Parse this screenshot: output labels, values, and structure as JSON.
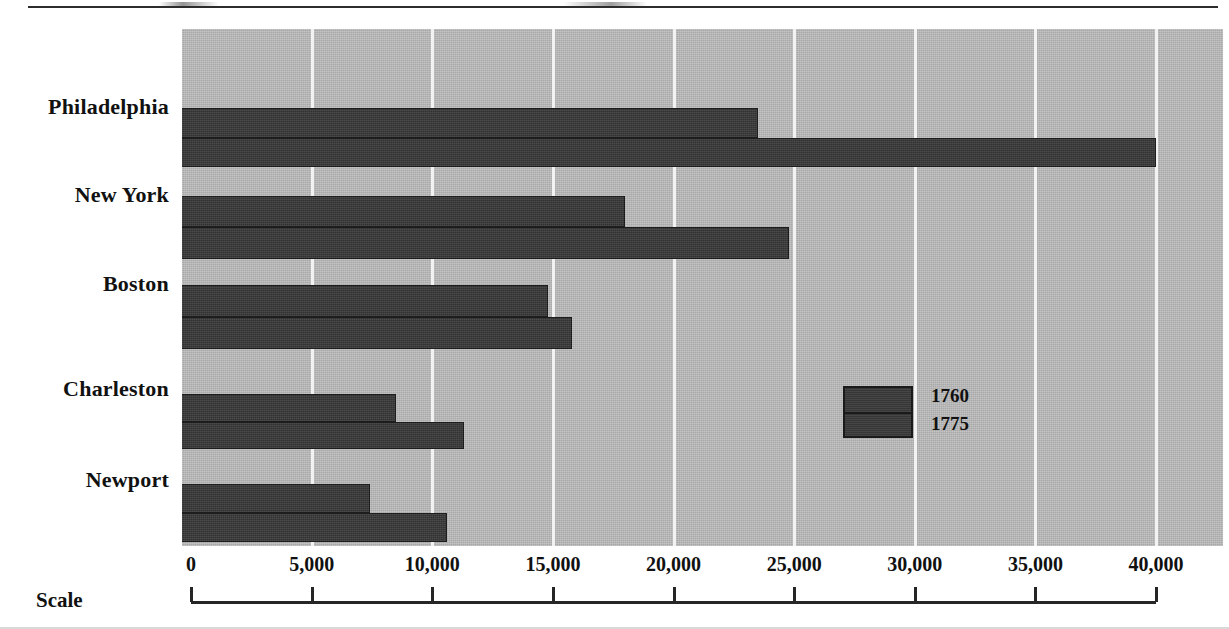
{
  "page": {
    "top_rule_present": true
  },
  "chart_data": {
    "type": "bar",
    "orientation": "horizontal",
    "title": "",
    "subtitle": "",
    "xlabel": "Scale",
    "ylabel": "",
    "categories": [
      "Philadelphia",
      "New York",
      "Boston",
      "Charleston",
      "Newport"
    ],
    "series": [
      {
        "name": "1760",
        "values": [
          23500,
          18000,
          14800,
          8500,
          7400
        ]
      },
      {
        "name": "1775",
        "values": [
          40000,
          24800,
          15800,
          11300,
          10600
        ]
      }
    ],
    "xlim": [
      0,
      40000
    ],
    "xticks": [
      0,
      5000,
      10000,
      15000,
      20000,
      25000,
      30000,
      35000,
      40000
    ],
    "xtick_labels": [
      "0",
      "5,000",
      "10,000",
      "15,000",
      "20,000",
      "25,000",
      "30,000",
      "35,000",
      "40,000"
    ],
    "grid": true,
    "grid_axis": "x",
    "legend": {
      "position": "inside-right",
      "entries": [
        "1760",
        "1775"
      ]
    },
    "colors": {
      "bar": "#3c3c3c",
      "bar_outline": "#1d1d1d",
      "plot_background": "#b7b7b7",
      "gridline": "#f2f2f2",
      "axis": "#262626",
      "text": "#111111",
      "page_background": "#ffffff"
    }
  },
  "axis": {
    "scale_label": "Scale"
  },
  "legend": {
    "items": [
      {
        "label": "1760"
      },
      {
        "label": "1775"
      }
    ]
  }
}
